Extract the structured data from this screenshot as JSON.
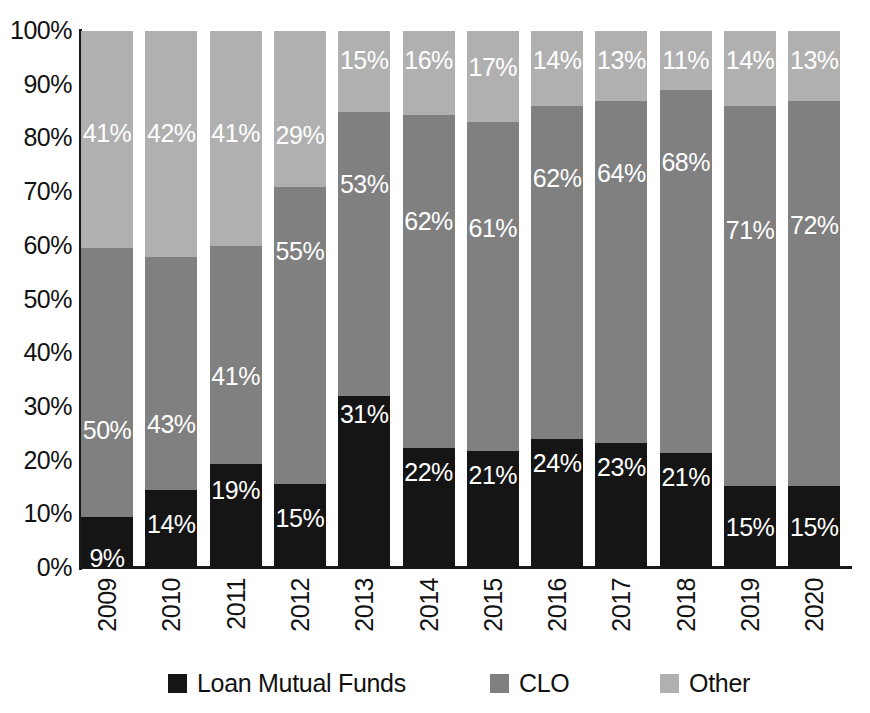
{
  "chart_data": {
    "type": "bar",
    "subtype": "100% stacked bar",
    "title": "",
    "xlabel": "",
    "ylabel": "",
    "ylim": [
      0,
      100
    ],
    "grid": false,
    "legend_position": "bottom",
    "categories": [
      "2009",
      "2010",
      "2011",
      "2012",
      "2013",
      "2014",
      "2015",
      "2016",
      "2017",
      "2018",
      "2019",
      "2020"
    ],
    "series": [
      {
        "name": "Loan Mutual Funds",
        "color": "#151515",
        "values": [
          9,
          14,
          19,
          15,
          31,
          22,
          21,
          24,
          23,
          21,
          15,
          15
        ],
        "labels": [
          "9%",
          "14%",
          "19%",
          "15%",
          "31%",
          "22%",
          "21%",
          "24%",
          "23%",
          "21%",
          "15%",
          "15%"
        ]
      },
      {
        "name": "CLO",
        "color": "#808080",
        "values": [
          50,
          43,
          41,
          55,
          53,
          62,
          61,
          62,
          64,
          68,
          71,
          72
        ],
        "labels": [
          "50%",
          "43%",
          "41%",
          "55%",
          "53%",
          "62%",
          "61%",
          "62%",
          "64%",
          "68%",
          "71%",
          "72%"
        ]
      },
      {
        "name": "Other",
        "color": "#b0b0b0",
        "values": [
          41,
          42,
          41,
          29,
          15,
          16,
          17,
          14,
          13,
          11,
          14,
          13
        ],
        "labels": [
          "41%",
          "42%",
          "41%",
          "29%",
          "15%",
          "16%",
          "17%",
          "14%",
          "13%",
          "11%",
          "14%",
          "13%"
        ]
      }
    ],
    "ytick_labels": [
      "100%",
      "90%",
      "80%",
      "70%",
      "60%",
      "50%",
      "40%",
      "30%",
      "20%",
      "10%",
      "0%"
    ],
    "ytick_values": [
      100,
      90,
      80,
      70,
      60,
      50,
      40,
      30,
      20,
      10,
      0
    ]
  },
  "legend": {
    "items": [
      {
        "label": "Loan Mutual Funds",
        "color": "#151515",
        "swatch": "legend-swatch-black"
      },
      {
        "label": "CLO",
        "color": "#808080",
        "swatch": "legend-swatch-gray"
      },
      {
        "label": "Other",
        "color": "#b0b0b0",
        "swatch": "legend-swatch-lightgray"
      }
    ]
  },
  "axes": {
    "y_axis_name": "percent-share-axis",
    "x_axis_name": "year-axis"
  },
  "render": {
    "plot_left": 81,
    "plot_top": 31,
    "plot_width": 771,
    "plot_height": 537,
    "bar_width": 52,
    "bar_pitch": 64.3,
    "stack_fractions": [
      {
        "lmf": 9.5,
        "clo": 50.0,
        "other": 40.5
      },
      {
        "lmf": 14.6,
        "clo": 43.4,
        "other": 42.0
      },
      {
        "lmf": 19.3,
        "clo": 40.7,
        "other": 40.0
      },
      {
        "lmf": 15.7,
        "clo": 55.3,
        "other": 29.0
      },
      {
        "lmf": 32.0,
        "clo": 53.0,
        "other": 15.0
      },
      {
        "lmf": 22.3,
        "clo": 62.0,
        "other": 15.7
      },
      {
        "lmf": 21.8,
        "clo": 61.2,
        "other": 17.0
      },
      {
        "lmf": 24.0,
        "clo": 62.0,
        "other": 14.0
      },
      {
        "lmf": 23.3,
        "clo": 63.7,
        "other": 13.0
      },
      {
        "lmf": 21.5,
        "clo": 67.5,
        "other": 11.0
      },
      {
        "lmf": 15.3,
        "clo": 70.7,
        "other": 14.0
      },
      {
        "lmf": 15.2,
        "clo": 71.8,
        "other": 13.0
      }
    ],
    "label_offsets": {
      "lmf": [
        29,
        22,
        14,
        22,
        6,
        12,
        12,
        12,
        12,
        12,
        29,
        29
      ],
      "clo": [
        170,
        155,
        118,
        52,
        60,
        94,
        94,
        60,
        60,
        60,
        112,
        112
      ],
      "other": [
        90,
        90,
        90,
        92,
        17,
        17,
        24,
        17,
        17,
        17,
        17,
        17
      ]
    }
  }
}
